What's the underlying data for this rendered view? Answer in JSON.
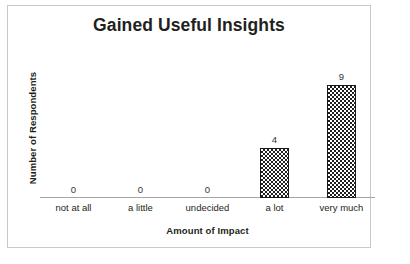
{
  "chart_data": {
    "type": "bar",
    "title": "Gained Useful Insights",
    "xlabel": "Amount of Impact",
    "ylabel": "Number of Respondents",
    "categories": [
      "not at all",
      "a little",
      "undecided",
      "a lot",
      "very much"
    ],
    "values": [
      0,
      0,
      0,
      4,
      9
    ],
    "value_labels": [
      "0",
      "0",
      "0",
      "4",
      "9"
    ],
    "ylim": [
      0,
      10
    ],
    "grid": false,
    "legend": "none",
    "series": [
      {
        "name": "Number of Respondents",
        "values": [
          0,
          0,
          0,
          4,
          9
        ]
      }
    ],
    "style": {
      "bar_fill": "checkerboard",
      "bar_pattern_color": "#1f1f1f",
      "bar_background": "#ffffff",
      "bar_border_color": "#1a1a1a",
      "axis_line_color": "#a6a6a6",
      "frame_border_color": "#c9c9c9",
      "text_color": "#231f20",
      "plot_background": "#ffffff"
    }
  }
}
